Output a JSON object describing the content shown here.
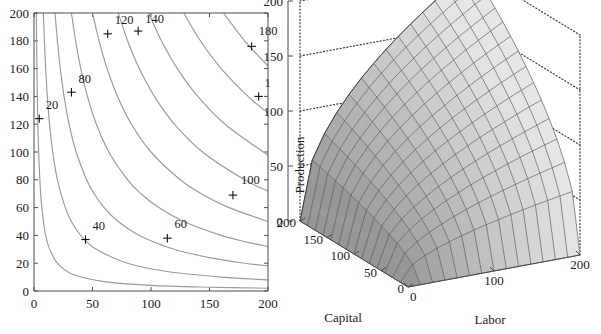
{
  "figure": {
    "panels": [
      "contour-plot",
      "surface-plot"
    ],
    "colors": {
      "contour_line": "#9a9a9a",
      "axis": "#4a4a4a",
      "text": "#1a1a1a",
      "surface_light": "#d8d8d8",
      "surface_dark": "#a2a2a2",
      "mesh": "#4e4e4e",
      "dotted_frame": "#3b3b3b"
    }
  },
  "chart_data": [
    {
      "type": "line",
      "subtype": "contour",
      "title": "",
      "xlabel": "",
      "ylabel": "",
      "xlim": [
        0,
        200
      ],
      "ylim": [
        0,
        200
      ],
      "xticks": [
        0,
        50,
        100,
        150,
        200
      ],
      "yticks": [
        0,
        20,
        40,
        60,
        80,
        100,
        120,
        140,
        160,
        180,
        200
      ],
      "xtick_labels": [
        "0",
        "50",
        "100",
        "150",
        "200"
      ],
      "ytick_labels": [
        "0",
        "20",
        "40",
        "60",
        "80",
        "100",
        "120",
        "140",
        "160",
        "180",
        "200"
      ],
      "grid": false,
      "legend": "none",
      "levels": [
        20,
        40,
        60,
        80,
        100,
        120,
        140,
        160,
        180
      ],
      "level_labels": [
        "20",
        "40",
        "60",
        "80",
        "100",
        "120",
        "140",
        "160",
        "180"
      ],
      "function": "Production = Labor^0.5 * Capital^0.5 (Cobb-Douglas isoquants)",
      "contours": [
        {
          "level": 20,
          "label": "20",
          "label_xy": [
            10,
            131
          ],
          "marker_xy": [
            4.5,
            124
          ],
          "points": [
            [
              2,
              200
            ],
            [
              2.2,
              182
            ],
            [
              2.5,
              160
            ],
            [
              3.0,
              133
            ],
            [
              3.6,
              111
            ],
            [
              4.4,
              91
            ],
            [
              5.6,
              71
            ],
            [
              7.2,
              56
            ],
            [
              9.5,
              42
            ],
            [
              13,
              31
            ],
            [
              20,
              20
            ],
            [
              33,
              12
            ],
            [
              60,
              6.7
            ],
            [
              100,
              4.0
            ],
            [
              150,
              2.7
            ],
            [
              200,
              2.0
            ]
          ]
        },
        {
          "level": 40,
          "label": "40",
          "label_xy": [
            50,
            44
          ],
          "marker_xy": [
            44,
            37
          ],
          "points": [
            [
              8,
              200
            ],
            [
              8.9,
              180
            ],
            [
              10,
              160
            ],
            [
              11.4,
              140
            ],
            [
              13.3,
              120
            ],
            [
              16,
              100
            ],
            [
              20,
              80
            ],
            [
              26.7,
              60
            ],
            [
              32,
              50
            ],
            [
              40,
              40
            ],
            [
              53.3,
              30
            ],
            [
              80,
              20
            ],
            [
              114,
              14
            ],
            [
              160,
              10
            ],
            [
              200,
              8
            ]
          ]
        },
        {
          "level": 60,
          "label": "60",
          "label_xy": [
            120,
            45
          ],
          "marker_xy": [
            114,
            38
          ],
          "points": [
            [
              18,
              200
            ],
            [
              20,
              180
            ],
            [
              22.5,
              160
            ],
            [
              25.7,
              140
            ],
            [
              30,
              120
            ],
            [
              36,
              100
            ],
            [
              45,
              80
            ],
            [
              51.4,
              70
            ],
            [
              60,
              60
            ],
            [
              72,
              50
            ],
            [
              90,
              40
            ],
            [
              120,
              30
            ],
            [
              150,
              24
            ],
            [
              180,
              20
            ],
            [
              200,
              18
            ]
          ]
        },
        {
          "level": 80,
          "label": "80",
          "label_xy": [
            38,
            150
          ],
          "marker_xy": [
            32,
            143
          ],
          "points": [
            [
              32,
              200
            ],
            [
              35.6,
              180
            ],
            [
              40,
              160
            ],
            [
              45.7,
              140
            ],
            [
              53.3,
              120
            ],
            [
              64,
              100
            ],
            [
              80,
              80
            ],
            [
              91.4,
              70
            ],
            [
              106.7,
              60
            ],
            [
              128,
              50
            ],
            [
              160,
              40
            ],
            [
              182.9,
              35
            ],
            [
              200,
              32
            ]
          ]
        },
        {
          "level": 100,
          "label": "100",
          "label_xy": [
            177,
            77
          ],
          "marker_xy": [
            170,
            69
          ],
          "points": [
            [
              50,
              200
            ],
            [
              55.6,
              180
            ],
            [
              62.5,
              160
            ],
            [
              71.4,
              140
            ],
            [
              83.3,
              120
            ],
            [
              100,
              100
            ],
            [
              125,
              80
            ],
            [
              142.9,
              70
            ],
            [
              166.7,
              60
            ],
            [
              200,
              50
            ]
          ]
        },
        {
          "level": 120,
          "label": "120",
          "label_xy": [
            69,
            192
          ],
          "marker_xy": [
            63,
            185
          ],
          "points": [
            [
              72,
              200
            ],
            [
              80,
              180
            ],
            [
              90,
              160
            ],
            [
              102.9,
              140
            ],
            [
              120,
              120
            ],
            [
              144,
              100
            ],
            [
              180,
              80
            ],
            [
              200,
              72
            ]
          ]
        },
        {
          "level": 140,
          "label": "140",
          "label_xy": [
            95,
            193
          ],
          "marker_xy": [
            89,
            187
          ],
          "points": [
            [
              98,
              200
            ],
            [
              108.9,
              180
            ],
            [
              122.5,
              160
            ],
            [
              140,
              140
            ],
            [
              163.3,
              120
            ],
            [
              196,
              100
            ],
            [
              200,
              98
            ]
          ]
        },
        {
          "level": 160,
          "label": "1",
          "full_label": "160",
          "clipped": true,
          "label_xy": [
            197,
            147
          ],
          "marker_xy": [
            192,
            140
          ],
          "points": [
            [
              128,
              200
            ],
            [
              142.2,
              180
            ],
            [
              160,
              160
            ],
            [
              182.9,
              140
            ],
            [
              200,
              128
            ]
          ]
        },
        {
          "level": 180,
          "label": "180",
          "label_xy": [
            192,
            184
          ],
          "marker_xy": [
            186,
            176
          ],
          "points": [
            [
              162,
              200
            ],
            [
              180,
              180
            ],
            [
              200,
              162
            ]
          ]
        }
      ]
    },
    {
      "type": "surface",
      "subtype": "3d-mesh-surface",
      "title": "",
      "xlabel": "Labor",
      "ylabel": "Capital",
      "zlabel": "Production",
      "xlim": [
        0,
        200
      ],
      "ylim": [
        0,
        200
      ],
      "zlim": [
        0,
        200
      ],
      "xticks": [
        0,
        100,
        200
      ],
      "xtick_labels": [
        "0",
        "100",
        "200"
      ],
      "yticks": [
        0,
        50,
        100,
        150,
        200
      ],
      "ytick_labels": [
        "0",
        "50",
        "100",
        "150",
        "200"
      ],
      "zticks": [
        0,
        50,
        100,
        150,
        200
      ],
      "ztick_labels": [
        "0",
        "50",
        "100",
        "150",
        "200"
      ],
      "grid": "dotted-back-walls",
      "legend": "none",
      "function": "Production = Labor^0.5 * Capital^0.5",
      "mesh_divisions": 14,
      "peak_value": 200,
      "peak_at": {
        "labor": 200,
        "capital": 200
      }
    }
  ],
  "contour_plot": {
    "name": "Isoquant contour plot of production",
    "axis_titles": {
      "x": "",
      "y": ""
    }
  },
  "surface_plot": {
    "name": "3D production surface",
    "axis_titles": {
      "x": "Labor",
      "y": "Capital",
      "z": "Production"
    }
  }
}
